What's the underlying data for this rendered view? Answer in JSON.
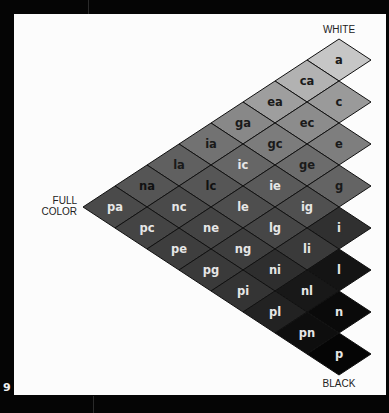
{
  "page_number": "9",
  "labels": {
    "white": "WHITE",
    "full_color_line1": "FULL",
    "full_color_line2": "COLOR",
    "black": "BLACK"
  },
  "grid": {
    "row_letters": [
      "a",
      "c",
      "e",
      "g",
      "i",
      "l",
      "n",
      "p"
    ],
    "origin": {
      "x": 339,
      "y": 60
    },
    "half_width": 32,
    "half_height": 21,
    "stroke": "#111111"
  },
  "cells": [
    {
      "name": "a",
      "r": 0,
      "k": 0,
      "fill": "#c6c6c6",
      "text": "#1a1a1a"
    },
    {
      "name": "ca",
      "r": 0,
      "k": 1,
      "fill": "#b2b2b2",
      "text": "#1a1a1a"
    },
    {
      "name": "ea",
      "r": 0,
      "k": 2,
      "fill": "#9e9e9e",
      "text": "#1a1a1a"
    },
    {
      "name": "ga",
      "r": 0,
      "k": 3,
      "fill": "#888888",
      "text": "#1a1a1a"
    },
    {
      "name": "ia",
      "r": 0,
      "k": 4,
      "fill": "#727272",
      "text": "#1a1a1a"
    },
    {
      "name": "la",
      "r": 0,
      "k": 5,
      "fill": "#606060",
      "text": "#1a1a1a"
    },
    {
      "name": "na",
      "r": 0,
      "k": 6,
      "fill": "#555555",
      "text": "#111111"
    },
    {
      "name": "pa",
      "r": 0,
      "k": 7,
      "fill": "#4a4a4a",
      "text": "#e6e6e6"
    },
    {
      "name": "c",
      "r": 1,
      "k": 0,
      "fill": "#9a9a9a",
      "text": "#1a1a1a"
    },
    {
      "name": "ec",
      "r": 1,
      "k": 1,
      "fill": "#8c8c8c",
      "text": "#1a1a1a"
    },
    {
      "name": "gc",
      "r": 1,
      "k": 2,
      "fill": "#7c7c7c",
      "text": "#1a1a1a"
    },
    {
      "name": "ic",
      "r": 1,
      "k": 3,
      "fill": "#666666",
      "text": "#e6e6e6"
    },
    {
      "name": "lc",
      "r": 1,
      "k": 4,
      "fill": "#565656",
      "text": "#111111"
    },
    {
      "name": "nc",
      "r": 1,
      "k": 5,
      "fill": "#4a4a4a",
      "text": "#e6e6e6"
    },
    {
      "name": "pc",
      "r": 1,
      "k": 6,
      "fill": "#444444",
      "text": "#e6e6e6"
    },
    {
      "name": "e",
      "r": 2,
      "k": 0,
      "fill": "#7e7e7e",
      "text": "#1a1a1a"
    },
    {
      "name": "ge",
      "r": 2,
      "k": 1,
      "fill": "#6c6c6c",
      "text": "#1a1a1a"
    },
    {
      "name": "ie",
      "r": 2,
      "k": 2,
      "fill": "#5a5a5a",
      "text": "#e6e6e6"
    },
    {
      "name": "le",
      "r": 2,
      "k": 3,
      "fill": "#4e4e4e",
      "text": "#e6e6e6"
    },
    {
      "name": "ne",
      "r": 2,
      "k": 4,
      "fill": "#444444",
      "text": "#e6e6e6"
    },
    {
      "name": "pe",
      "r": 2,
      "k": 5,
      "fill": "#3e3e3e",
      "text": "#e6e6e6"
    },
    {
      "name": "g",
      "r": 3,
      "k": 0,
      "fill": "#646464",
      "text": "#1a1a1a"
    },
    {
      "name": "ig",
      "r": 3,
      "k": 1,
      "fill": "#505050",
      "text": "#e6e6e6"
    },
    {
      "name": "lg",
      "r": 3,
      "k": 2,
      "fill": "#464646",
      "text": "#e6e6e6"
    },
    {
      "name": "ng",
      "r": 3,
      "k": 3,
      "fill": "#3e3e3e",
      "text": "#e6e6e6"
    },
    {
      "name": "pg",
      "r": 3,
      "k": 4,
      "fill": "#3a3a3a",
      "text": "#e6e6e6"
    },
    {
      "name": "i",
      "r": 4,
      "k": 0,
      "fill": "#303030",
      "text": "#e6e6e6"
    },
    {
      "name": "li",
      "r": 4,
      "k": 1,
      "fill": "#3a3a3a",
      "text": "#e6e6e6"
    },
    {
      "name": "ni",
      "r": 4,
      "k": 2,
      "fill": "#2e2e2e",
      "text": "#e6e6e6"
    },
    {
      "name": "pi",
      "r": 4,
      "k": 3,
      "fill": "#343434",
      "text": "#e6e6e6"
    },
    {
      "name": "l",
      "r": 5,
      "k": 0,
      "fill": "#141414",
      "text": "#e6e6e6"
    },
    {
      "name": "nl",
      "r": 5,
      "k": 1,
      "fill": "#181818",
      "text": "#e6e6e6"
    },
    {
      "name": "pl",
      "r": 5,
      "k": 2,
      "fill": "#222222",
      "text": "#e6e6e6"
    },
    {
      "name": "n",
      "r": 6,
      "k": 0,
      "fill": "#0a0a0a",
      "text": "#e6e6e6"
    },
    {
      "name": "pn",
      "r": 6,
      "k": 1,
      "fill": "#0e0e0e",
      "text": "#e6e6e6"
    },
    {
      "name": "p",
      "r": 7,
      "k": 0,
      "fill": "#050505",
      "text": "#e6e6e6"
    }
  ]
}
